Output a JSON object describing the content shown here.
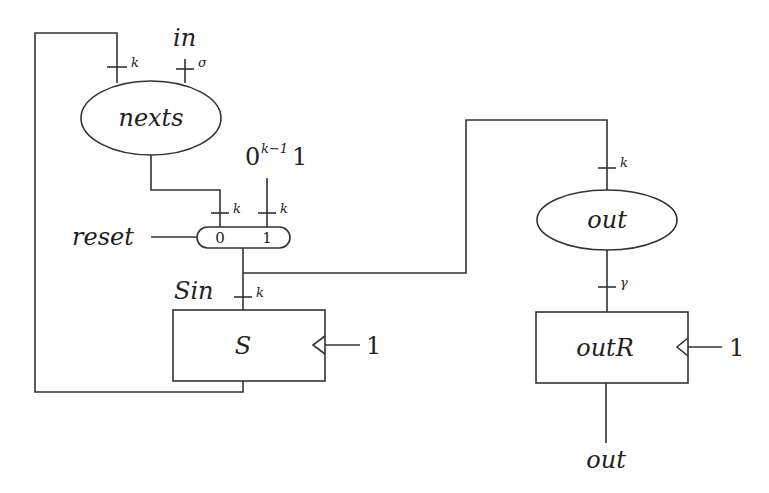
{
  "diagram": {
    "type": "circuit-block-diagram",
    "nodes": {
      "nexts": {
        "label": "nexts",
        "shape": "ellipse"
      },
      "mux": {
        "input0": "0",
        "input1": "1",
        "select_label": "reset",
        "shape": "rounded-pill"
      },
      "S": {
        "label": "S",
        "shape": "register",
        "clock_label": "1"
      },
      "out_fn": {
        "label": "out",
        "shape": "ellipse"
      },
      "outR": {
        "label": "outR",
        "shape": "register",
        "clock_label": "1"
      }
    },
    "labels": {
      "in": "in",
      "const_base": "0",
      "const_exp": "k−1",
      "const_tail": "1",
      "reset": "reset",
      "sin": "Sin",
      "out_terminal": "out"
    },
    "bus_widths": {
      "feedback_to_nexts": "k",
      "in_to_nexts": "σ",
      "nexts_to_mux0": "k",
      "const_to_mux1": "k",
      "sin_to_S": "k",
      "to_out_fn": "k",
      "out_fn_to_outR": "γ"
    }
  }
}
